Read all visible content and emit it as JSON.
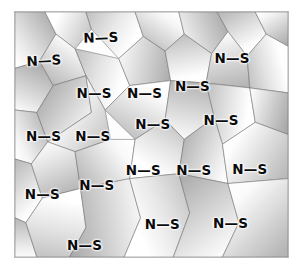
{
  "figure": {
    "kind": "magnetic-domain-micrograph",
    "frame": {
      "border_color": "#b9b9b9",
      "background_color": "#fdfdfd",
      "x": 14,
      "y": 11,
      "width": 275,
      "height": 247
    },
    "page_background": "#ffffff",
    "label_color": "#0b0b0b",
    "grain_outline_color": "#6e6e6e",
    "grain_shade_light": "#ffffff",
    "grain_shade_dark": "#9a9a9a"
  },
  "labels": [
    {
      "id": "ns-01",
      "text": "N—S",
      "x": 31.5,
      "y": 10.5,
      "rotation": -2
    },
    {
      "id": "ns-02",
      "text": "N—S",
      "x": 10.5,
      "y": 20.0,
      "rotation": -3
    },
    {
      "id": "ns-03",
      "text": "N—S",
      "x": 79.5,
      "y": 19.0,
      "rotation": 0
    },
    {
      "id": "ns-04",
      "text": "N—S",
      "x": 29.0,
      "y": 33.5,
      "rotation": 0
    },
    {
      "id": "ns-05",
      "text": "N—S",
      "x": 47.5,
      "y": 33.5,
      "rotation": 0
    },
    {
      "id": "ns-06",
      "text": "N—S",
      "x": 65.0,
      "y": 30.5,
      "rotation": 0
    },
    {
      "id": "ns-07",
      "text": "N—S",
      "x": 10.5,
      "y": 51.0,
      "rotation": 0
    },
    {
      "id": "ns-08",
      "text": "N—S",
      "x": 28.5,
      "y": 51.0,
      "rotation": 0
    },
    {
      "id": "ns-09",
      "text": "N—S",
      "x": 50.5,
      "y": 46.0,
      "rotation": 0
    },
    {
      "id": "ns-10",
      "text": "N—S",
      "x": 75.5,
      "y": 44.5,
      "rotation": 0
    },
    {
      "id": "ns-11",
      "text": "N—S",
      "x": 47.0,
      "y": 65.0,
      "rotation": 0
    },
    {
      "id": "ns-12",
      "text": "N—S",
      "x": 65.5,
      "y": 65.0,
      "rotation": 0
    },
    {
      "id": "ns-13",
      "text": "N—S",
      "x": 86.0,
      "y": 64.5,
      "rotation": 0
    },
    {
      "id": "ns-14",
      "text": "N—S",
      "x": 10.0,
      "y": 74.5,
      "rotation": 0
    },
    {
      "id": "ns-15",
      "text": "N—S",
      "x": 30.0,
      "y": 71.0,
      "rotation": 0
    },
    {
      "id": "ns-16",
      "text": "N—S",
      "x": 54.0,
      "y": 87.0,
      "rotation": 0
    },
    {
      "id": "ns-17",
      "text": "N—S",
      "x": 79.0,
      "y": 86.5,
      "rotation": 0
    },
    {
      "id": "ns-18",
      "text": "N—S",
      "x": 25.5,
      "y": 95.5,
      "rotation": 0
    }
  ],
  "grains": [
    {
      "id": "g01",
      "points": "0,0 11,0 15,9 9,20 0,23",
      "angle": 135,
      "dark": 0.3
    },
    {
      "id": "g02",
      "points": "11,0 26,0 28,7 22,15 15,9",
      "angle": 200,
      "dark": 0.12
    },
    {
      "id": "g03",
      "points": "26,0 44,0 47,10 38,19 28,7",
      "angle": 25,
      "dark": 0.05
    },
    {
      "id": "g04",
      "points": "44,0 60,0 62,9 55,16 47,10",
      "angle": 310,
      "dark": 0.22
    },
    {
      "id": "g05",
      "points": "60,0 74,0 78,8 72,17 62,9",
      "angle": 160,
      "dark": 0.34
    },
    {
      "id": "g06",
      "points": "74,0 88,0 92,9 85,18 78,8",
      "angle": 60,
      "dark": 0.14
    },
    {
      "id": "g07",
      "points": "88,0 100,0 100,14 92,9",
      "angle": 240,
      "dark": 0.28
    },
    {
      "id": "g08",
      "points": "0,23 9,20 14,30 8,41 0,40",
      "angle": 110,
      "dark": 0.38
    },
    {
      "id": "g09",
      "points": "9,20 15,9 22,15 26,26 14,30",
      "angle": 300,
      "dark": 0.2
    },
    {
      "id": "g10",
      "points": "22,15 38,19 42,30 33,40 26,26",
      "angle": 20,
      "dark": 0.08
    },
    {
      "id": "g11",
      "points": "38,19 47,10 55,16 57,28 42,30",
      "angle": 190,
      "dark": 0.32
    },
    {
      "id": "g12",
      "points": "55,16 62,9 72,17 70,29 57,28",
      "angle": 80,
      "dark": 0.16
    },
    {
      "id": "g13",
      "points": "72,17 78,8 85,18 86,31 70,29",
      "angle": 260,
      "dark": 0.26
    },
    {
      "id": "g14",
      "points": "85,18 92,9 100,14 100,33 86,31",
      "angle": 340,
      "dark": 0.1
    },
    {
      "id": "g15",
      "points": "0,40 8,41 12,53 6,62 0,60",
      "angle": 140,
      "dark": 0.24
    },
    {
      "id": "g16",
      "points": "8,41 14,30 26,26 28,41 12,53",
      "angle": 40,
      "dark": 0.36
    },
    {
      "id": "g17",
      "points": "26,26 33,40 35,52 22,57 12,53 28,41",
      "angle": 220,
      "dark": 0.06
    },
    {
      "id": "g18",
      "points": "33,40 42,30 57,28 55,44 44,52",
      "angle": 300,
      "dark": 0.18
    },
    {
      "id": "g19",
      "points": "57,28 70,29 73,43 62,52 55,44",
      "angle": 100,
      "dark": 0.3
    },
    {
      "id": "g20",
      "points": "70,29 86,31 88,45 76,54 73,43",
      "angle": 10,
      "dark": 0.12
    },
    {
      "id": "g21",
      "points": "86,31 100,33 100,50 88,45",
      "angle": 200,
      "dark": 0.34
    },
    {
      "id": "g22",
      "points": "0,60 6,62 10,76 4,86 0,84",
      "angle": 70,
      "dark": 0.14
    },
    {
      "id": "g23",
      "points": "6,62 12,53 22,57 24,72 10,76",
      "angle": 250,
      "dark": 0.28
    },
    {
      "id": "g24",
      "points": "22,57 35,52 44,52 42,68 24,72",
      "angle": 330,
      "dark": 0.2
    },
    {
      "id": "g25",
      "points": "44,52 55,44 62,52 60,66 42,68",
      "angle": 120,
      "dark": 0.08
    },
    {
      "id": "g26",
      "points": "62,52 73,43 76,54 78,70 60,66",
      "angle": 30,
      "dark": 0.32
    },
    {
      "id": "g27",
      "points": "76,54 88,45 100,50 100,68 78,70",
      "angle": 210,
      "dark": 0.16
    },
    {
      "id": "g28",
      "points": "0,84 4,86 8,100 0,100",
      "angle": 90,
      "dark": 0.26
    },
    {
      "id": "g29",
      "points": "4,86 10,76 24,72 26,88 20,100 8,100",
      "angle": 280,
      "dark": 0.1
    },
    {
      "id": "g30",
      "points": "24,72 42,68 46,84 40,100 20,100 26,88",
      "angle": 350,
      "dark": 0.34
    },
    {
      "id": "g31",
      "points": "42,68 60,66 64,82 58,100 40,100 46,84",
      "angle": 150,
      "dark": 0.06
    },
    {
      "id": "g32",
      "points": "60,66 78,70 82,86 76,100 58,100 64,82",
      "angle": 60,
      "dark": 0.3
    },
    {
      "id": "g33",
      "points": "78,70 100,68 100,100 76,100 82,86",
      "angle": 230,
      "dark": 0.18
    }
  ]
}
